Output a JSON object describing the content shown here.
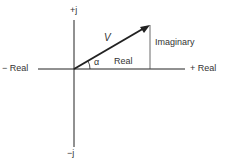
{
  "diagram": {
    "labels": {
      "pos_imag": "+j",
      "neg_imag": "−j",
      "neg_real": "− Real",
      "pos_real": "+ Real",
      "vector": "V",
      "angle": "α",
      "real_component": "Real",
      "imag_component": "Imaginary"
    },
    "colors": {
      "line": "#222222",
      "text": "#333333"
    }
  }
}
